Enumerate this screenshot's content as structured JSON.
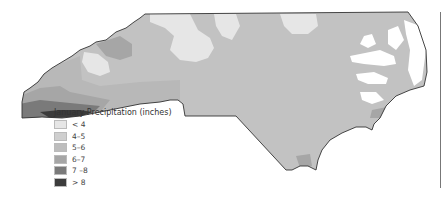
{
  "map": {
    "title": "January Precipitation (inches)",
    "region": "North Carolina",
    "base_fill": "#c2c2c2",
    "outline_color": "#333333"
  },
  "legend": {
    "title": "January Precipitation (inches)",
    "items": [
      {
        "label": "< 4",
        "color": "#e6e6e6"
      },
      {
        "label": "4–5",
        "color": "#cfcfcf"
      },
      {
        "label": "5–6",
        "color": "#bdbdbd"
      },
      {
        "label": "6–7",
        "color": "#a6a6a6"
      },
      {
        "label": "7 –8",
        "color": "#7a7a7a"
      },
      {
        "label": "> 8",
        "color": "#3c3c3c"
      }
    ]
  }
}
